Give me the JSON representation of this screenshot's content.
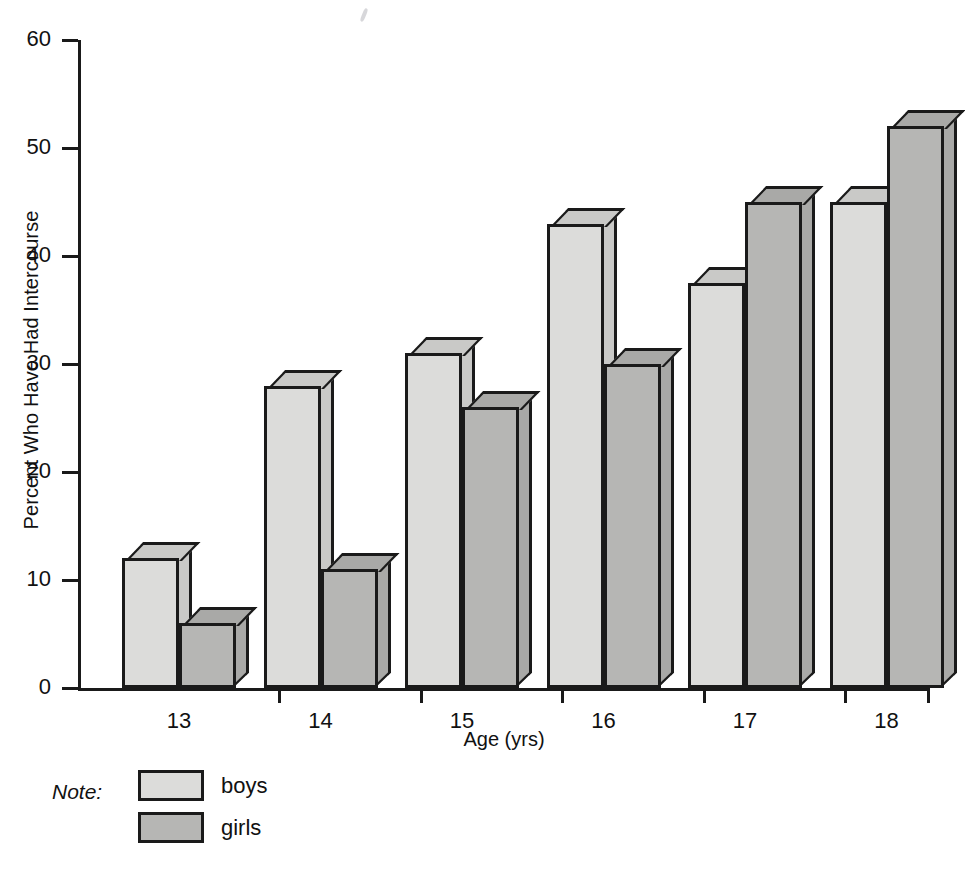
{
  "chart_data": {
    "type": "bar",
    "title": "",
    "subtitle": "",
    "xlabel": "Age (yrs)",
    "ylabel": "Percent Who Have Had Intercourse",
    "categories": [
      "13",
      "14",
      "15",
      "16",
      "17",
      "18"
    ],
    "series": [
      {
        "name": "boys",
        "values": [
          12,
          28,
          31,
          43,
          37.5,
          45
        ]
      },
      {
        "name": "girls",
        "values": [
          6,
          11,
          26,
          30,
          45,
          52
        ]
      }
    ],
    "ylim": [
      0,
      60
    ],
    "ytick_values": [
      0,
      10,
      20,
      30,
      40,
      50,
      60
    ],
    "ytick_labels": [
      "0",
      "10",
      "20",
      "30",
      "40",
      "50",
      "60"
    ],
    "grid": false,
    "legend_position": "below-left",
    "style": "3d-extruded-bars-grayscale",
    "colors": {
      "boys_fill": "#dcdcda",
      "girls_fill": "#b6b6b4",
      "boys_shade": "#c9c9c7",
      "girls_shade": "#a9a9a7",
      "outline": "#1a1a1a",
      "background": "#ffffff"
    }
  },
  "legend": {
    "note_label": "Note:",
    "entries": [
      {
        "label": "boys"
      },
      {
        "label": "girls"
      }
    ]
  }
}
